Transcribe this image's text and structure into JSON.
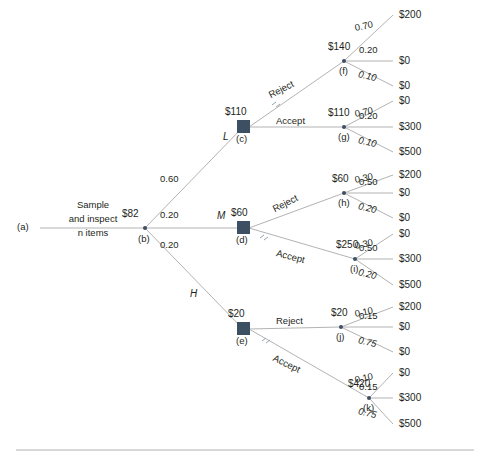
{
  "figure": {
    "type": "decision-tree"
  },
  "root": {
    "entry_label": "(a)",
    "sample_line1": "Sample",
    "sample_line2": "and inspect",
    "sample_line3_italic": "n",
    "sample_line3_rest": " items",
    "ev": "$82",
    "node_id": "(b)"
  },
  "branches": [
    {
      "state": "L",
      "probability": "0.60",
      "decision_node": {
        "ev": "$110",
        "node_id": "(c)"
      },
      "options": [
        {
          "label": "Reject",
          "chance_node": {
            "ev": "$140",
            "node_id": "(f)"
          },
          "outcomes": [
            {
              "probability": "0.70",
              "payoff": "$200"
            },
            {
              "probability": "0.20",
              "payoff": "$0"
            },
            {
              "probability": "0.10",
              "payoff": "$0"
            }
          ]
        },
        {
          "label": "Accept",
          "chance_node": {
            "ev": "$110",
            "node_id": "(g)"
          },
          "outcomes": [
            {
              "probability": "0.70",
              "payoff": "$0"
            },
            {
              "probability": "0.20",
              "payoff": "$300"
            },
            {
              "probability": "0.10",
              "payoff": "$500"
            }
          ]
        }
      ]
    },
    {
      "state": "M",
      "probability": "0.20",
      "decision_node": {
        "ev": "$60",
        "node_id": "(d)"
      },
      "options": [
        {
          "label": "Reject",
          "chance_node": {
            "ev": "$60",
            "node_id": "(h)"
          },
          "outcomes": [
            {
              "probability": "0.30",
              "payoff": "$200"
            },
            {
              "probability": "0.50",
              "payoff": "$0"
            },
            {
              "probability": "0.20",
              "payoff": "$0"
            }
          ]
        },
        {
          "label": "Accept",
          "chance_node": {
            "ev": "$250",
            "node_id": "(i)"
          },
          "outcomes": [
            {
              "probability": "0.30",
              "payoff": "$0"
            },
            {
              "probability": "0.50",
              "payoff": "$300"
            },
            {
              "probability": "0.20",
              "payoff": "$500"
            }
          ]
        }
      ]
    },
    {
      "state": "H",
      "probability": "0.20",
      "decision_node": {
        "ev": "$20",
        "node_id": "(e)"
      },
      "options": [
        {
          "label": "Reject",
          "chance_node": {
            "ev": "$20",
            "node_id": "(j)"
          },
          "outcomes": [
            {
              "probability": "0.10",
              "payoff": "$200"
            },
            {
              "probability": "0.15",
              "payoff": "$0"
            },
            {
              "probability": "0.75",
              "payoff": "$0"
            }
          ]
        },
        {
          "label": "Accept",
          "chance_node": {
            "ev": "$420",
            "node_id": "(k)"
          },
          "outcomes": [
            {
              "probability": "0.10",
              "payoff": "$0"
            },
            {
              "probability": "0.15",
              "payoff": "$300"
            },
            {
              "probability": "0.75",
              "payoff": "$500"
            }
          ]
        }
      ]
    }
  ],
  "colors": {
    "node_fill": "#3d4f63",
    "line": "#b3b3b3",
    "text": "#231f20",
    "rule": "#b0b0b0"
  }
}
